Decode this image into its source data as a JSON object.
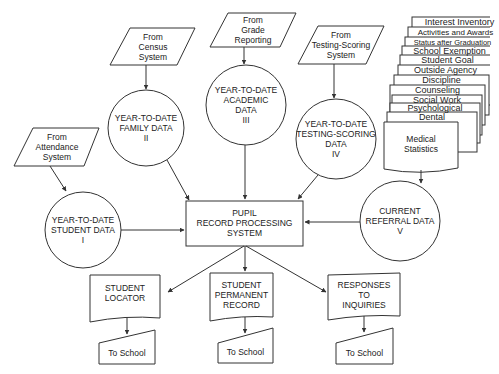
{
  "diagram": {
    "type": "data-flow",
    "sources": [
      {
        "id": "attendance",
        "lines": [
          "From",
          "Attendance",
          "System"
        ]
      },
      {
        "id": "census",
        "lines": [
          "From",
          "Census",
          "System"
        ]
      },
      {
        "id": "grade",
        "lines": [
          "From",
          "Grade",
          "Reporting"
        ]
      },
      {
        "id": "testing",
        "lines": [
          "From",
          "Testing-Scoring",
          "System"
        ]
      }
    ],
    "data_stores": [
      {
        "id": "student",
        "lines": [
          "YEAR-TO-DATE",
          "STUDENT DATA",
          "I"
        ]
      },
      {
        "id": "family",
        "lines": [
          "YEAR-TO-DATE",
          "FAMILY DATA",
          "II"
        ]
      },
      {
        "id": "academic",
        "lines": [
          "YEAR-TO-DATE",
          "ACADEMIC",
          "DATA",
          "III"
        ]
      },
      {
        "id": "testing",
        "lines": [
          "YEAR-TO-DATE",
          "TESTING-SCORING",
          "DATA",
          "IV"
        ]
      },
      {
        "id": "referral",
        "lines": [
          "CURRENT",
          "REFERRAL DATA",
          "V"
        ]
      }
    ],
    "process": {
      "lines": [
        "PUPIL",
        "RECORD PROCESSING",
        "SYSTEM"
      ]
    },
    "referral_cards": [
      "Interest Inventory",
      "Activities and Awards",
      "Status after Graduation",
      "School Exemption",
      "Student Goal",
      "Outside Agency",
      "Discipline",
      "Counseling",
      "Social Work",
      "Psychological",
      "Dental"
    ],
    "referral_front_doc": {
      "lines": [
        "Medical",
        "Statistics"
      ]
    },
    "outputs": [
      {
        "id": "locator",
        "lines": [
          "STUDENT",
          "LOCATOR"
        ],
        "dest": "To School"
      },
      {
        "id": "permanent",
        "lines": [
          "STUDENT",
          "PERMANENT",
          "RECORD"
        ],
        "dest": "To School"
      },
      {
        "id": "inquiries",
        "lines": [
          "RESPONSES",
          "TO",
          "INQUIRIES"
        ],
        "dest": "To School"
      }
    ]
  }
}
